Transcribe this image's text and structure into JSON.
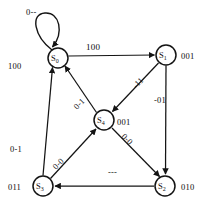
{
  "diagram": {
    "type": "finite-state-machine",
    "stroke_color": "#141414",
    "background_color": "#ffffff",
    "nodes": [
      {
        "id": "S0",
        "name": "S",
        "subscript": "0",
        "output": "100",
        "cx": 58,
        "cy": 58,
        "r": 10
      },
      {
        "id": "S1",
        "name": "S",
        "subscript": "1",
        "output": "001",
        "cx": 166,
        "cy": 55,
        "r": 10
      },
      {
        "id": "S4",
        "name": "S",
        "subscript": "4",
        "output": "001",
        "cx": 104,
        "cy": 120,
        "r": 10
      },
      {
        "id": "S3",
        "name": "S",
        "subscript": "3",
        "output": "011",
        "cx": 43,
        "cy": 186,
        "r": 10
      },
      {
        "id": "S2",
        "name": "S",
        "subscript": "2",
        "output": "010",
        "cx": 165,
        "cy": 186,
        "r": 10
      }
    ],
    "edges": [
      {
        "from": "S0",
        "to": "S0",
        "label": "0--",
        "kind": "self-loop"
      },
      {
        "from": "S0",
        "to": "S1",
        "label": "100",
        "kind": "straight-horizontal"
      },
      {
        "from": "S1",
        "to": "S4",
        "label": "-11",
        "kind": "diagonal"
      },
      {
        "from": "S1",
        "to": "S2",
        "label": "-01",
        "kind": "straight-vertical"
      },
      {
        "from": "S4",
        "to": "S0",
        "label": "0-1",
        "kind": "diagonal"
      },
      {
        "from": "S4",
        "to": "S2",
        "label": "0-0",
        "kind": "diagonal"
      },
      {
        "from": "S3",
        "to": "S4",
        "label": "0-0",
        "kind": "diagonal"
      },
      {
        "from": "S3",
        "to": "S0",
        "label": "0-1",
        "kind": "straight-vertical"
      },
      {
        "from": "S2",
        "to": "S3",
        "label": "---",
        "kind": "straight-horizontal"
      }
    ],
    "labels": {
      "self_loop": "0--",
      "s0_output": "100",
      "s1_output": "001",
      "s2_output": "010",
      "s3_output": "011",
      "s4_output": "001",
      "top_edge": "100",
      "right_edge": "-01",
      "left_edge": "0-1",
      "bottom_edge": "---",
      "diag_s1_s4": "-11",
      "diag_s4_s0": "0-1",
      "diag_s4_s2": "0-0",
      "diag_s3_s4": "0-0"
    },
    "node_names": {
      "s0": "S",
      "s0_sub": "0",
      "s1": "S",
      "s1_sub": "1",
      "s2": "S",
      "s2_sub": "2",
      "s3": "S",
      "s3_sub": "3",
      "s4": "S",
      "s4_sub": "4"
    }
  }
}
